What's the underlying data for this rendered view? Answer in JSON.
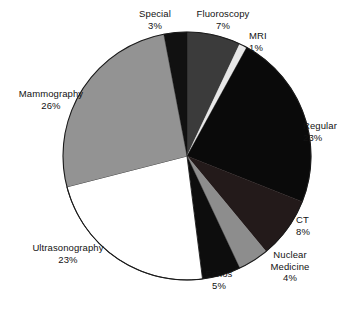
{
  "chart_data": {
    "type": "pie",
    "title": "",
    "subtitle": "",
    "xlabel": "",
    "ylabel": "",
    "legend_position": "none",
    "grid": false,
    "labels_show_percent": true,
    "start_angle_deg": 0,
    "direction": "clockwise",
    "categories": [
      "Fluoroscopy",
      "MRI",
      "Regular",
      "CT",
      "Nuclear Medicine",
      "Echos",
      "Ultrasonography",
      "Mammography",
      "Special"
    ],
    "values": [
      7,
      1,
      23,
      8,
      4,
      5,
      23,
      26,
      3
    ],
    "slices": [
      {
        "name": "Fluoroscopy",
        "label": "Fluoroscopy",
        "value": 7,
        "percent_text": "7%",
        "color": "#3b3b3b"
      },
      {
        "name": "MRI",
        "label": "MRI",
        "value": 1,
        "percent_text": "1%",
        "color": "#e8e8e8"
      },
      {
        "name": "Regular",
        "label": "Regular",
        "value": 23,
        "percent_text": "23%",
        "color": "#0a0a0a"
      },
      {
        "name": "CT",
        "label": "CT",
        "value": 8,
        "percent_text": "8%",
        "color": "#231a1a"
      },
      {
        "name": "Nuclear Medicine",
        "label": "Nuclear\nMedicine",
        "label_line1": "Nuclear",
        "label_line2": "Medicine",
        "value": 4,
        "percent_text": "4%",
        "color": "#8d8d8d"
      },
      {
        "name": "Echos",
        "label": "Echos",
        "value": 5,
        "percent_text": "5%",
        "color": "#0d0d0d"
      },
      {
        "name": "Ultrasonography",
        "label": "Ultrasonography",
        "value": 23,
        "percent_text": "23%",
        "color": "#ffffff"
      },
      {
        "name": "Mammography",
        "label": "Mammography",
        "value": 26,
        "percent_text": "26%",
        "color": "#939393"
      },
      {
        "name": "Special",
        "label": "Special",
        "value": 3,
        "percent_text": "3%",
        "color": "#111111"
      }
    ],
    "total": 100,
    "units": "percent"
  },
  "canvas": {
    "width": 362,
    "height": 311,
    "background": "#ffffff",
    "outline_color": "#1a1a1a"
  },
  "geometry": {
    "center_x": 187,
    "center_y": 156,
    "radius": 124
  }
}
